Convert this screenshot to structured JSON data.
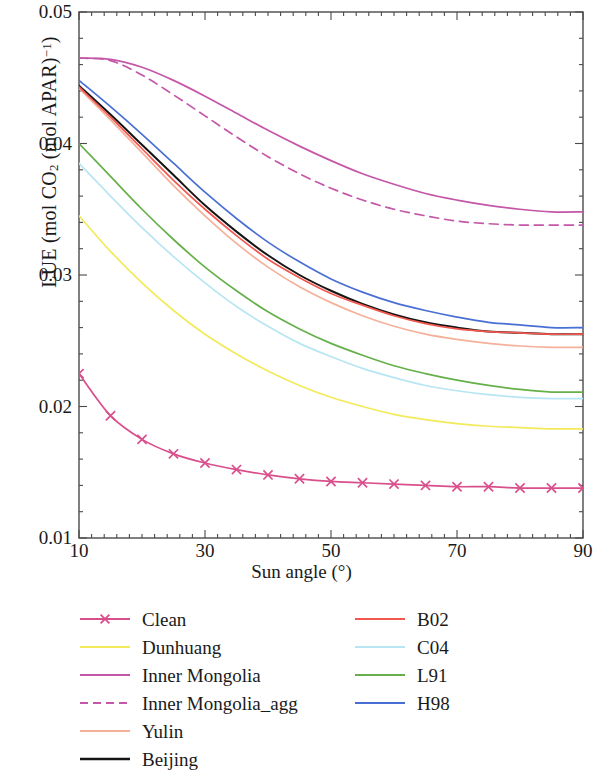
{
  "chart_data": {
    "type": "line",
    "title": "",
    "xlabel": "Sun angle (°)",
    "ylabel": "LUE (mol CO2 (mol APAR)-1)",
    "ylabel_parts": {
      "pre": "LUE (mol CO",
      "sub": "2",
      "mid": " (mol APAR)",
      "sup": "−1",
      "post": ")"
    },
    "xlim": [
      10,
      90
    ],
    "ylim": [
      0.01,
      0.05
    ],
    "xticks": [
      10,
      30,
      50,
      70,
      90
    ],
    "xtick_labels": [
      "10",
      "30",
      "50",
      "70",
      "90"
    ],
    "yticks": [
      0.01,
      0.02,
      0.03,
      0.04,
      0.05
    ],
    "ytick_labels": [
      "0.01",
      "0.02",
      "0.03",
      "0.04",
      "0.05"
    ],
    "x_minor_tick_step": 2,
    "y_minor_tick_step": 0.002,
    "grid": false,
    "legend_position": "below-plot",
    "legend_columns": 2,
    "x": [
      10,
      15,
      20,
      25,
      30,
      35,
      40,
      45,
      50,
      55,
      60,
      65,
      70,
      75,
      80,
      85,
      90
    ],
    "series": [
      {
        "name": "Clean",
        "color": "#d94f8c",
        "style": "solid",
        "marker": "x",
        "column": "left",
        "values": [
          0.0225,
          0.0193,
          0.0175,
          0.0164,
          0.0157,
          0.0152,
          0.0148,
          0.0145,
          0.0143,
          0.0142,
          0.0141,
          0.014,
          0.0139,
          0.0139,
          0.0138,
          0.0138,
          0.0138
        ]
      },
      {
        "name": "Dunhuang",
        "color": "#f2ea5a",
        "style": "solid",
        "marker": "none",
        "column": "left",
        "values": [
          0.0345,
          0.0318,
          0.0294,
          0.0273,
          0.0255,
          0.024,
          0.0227,
          0.0216,
          0.0207,
          0.02,
          0.0194,
          0.019,
          0.0187,
          0.0185,
          0.0184,
          0.0183,
          0.0183
        ]
      },
      {
        "name": "Inner Mongolia",
        "color": "#c457a8",
        "style": "solid",
        "marker": "none",
        "column": "left",
        "values": [
          0.0465,
          0.0464,
          0.0458,
          0.0448,
          0.0436,
          0.0423,
          0.041,
          0.0398,
          0.0387,
          0.0377,
          0.0369,
          0.0362,
          0.0357,
          0.0353,
          0.035,
          0.0348,
          0.0348
        ]
      },
      {
        "name": "Inner Mongolia_agg",
        "color": "#c457a8",
        "style": "dashed",
        "marker": "none",
        "column": "left",
        "values": [
          0.0465,
          0.0463,
          0.0452,
          0.0437,
          0.0421,
          0.0405,
          0.039,
          0.0377,
          0.0366,
          0.0357,
          0.035,
          0.0345,
          0.0341,
          0.0339,
          0.0338,
          0.0338,
          0.0338
        ]
      },
      {
        "name": "Yulin",
        "color": "#f5b09a",
        "style": "solid",
        "marker": "none",
        "column": "left",
        "values": [
          0.0442,
          0.0418,
          0.0393,
          0.0368,
          0.0345,
          0.0324,
          0.0306,
          0.0291,
          0.0279,
          0.0269,
          0.0261,
          0.0255,
          0.0251,
          0.0248,
          0.0246,
          0.0245,
          0.0245
        ]
      },
      {
        "name": "Beijing",
        "color": "#141414",
        "style": "solid",
        "marker": "none",
        "column": "left",
        "values": [
          0.0444,
          0.0422,
          0.0399,
          0.0376,
          0.0353,
          0.0333,
          0.0315,
          0.03,
          0.0288,
          0.0278,
          0.027,
          0.0264,
          0.026,
          0.0257,
          0.0256,
          0.0255,
          0.0255
        ]
      },
      {
        "name": "B02",
        "color": "#f2584f",
        "style": "solid",
        "marker": "none",
        "column": "right",
        "values": [
          0.0443,
          0.042,
          0.0396,
          0.0372,
          0.035,
          0.033,
          0.0312,
          0.0298,
          0.0286,
          0.0277,
          0.0269,
          0.0263,
          0.0259,
          0.0257,
          0.0256,
          0.0255,
          0.0255
        ]
      },
      {
        "name": "C04",
        "color": "#b7e6f2",
        "style": "solid",
        "marker": "none",
        "column": "right",
        "values": [
          0.0385,
          0.036,
          0.0336,
          0.0314,
          0.0294,
          0.0276,
          0.0261,
          0.0248,
          0.0238,
          0.0229,
          0.0222,
          0.0216,
          0.0212,
          0.0209,
          0.0207,
          0.0206,
          0.0206
        ]
      },
      {
        "name": "L91",
        "color": "#66b04a",
        "style": "solid",
        "marker": "none",
        "column": "right",
        "values": [
          0.04,
          0.0375,
          0.035,
          0.0327,
          0.0306,
          0.0288,
          0.0272,
          0.0259,
          0.0248,
          0.0239,
          0.0231,
          0.0225,
          0.022,
          0.0216,
          0.0213,
          0.0211,
          0.0211
        ]
      },
      {
        "name": "H98",
        "color": "#4a6fd4",
        "style": "solid",
        "marker": "none",
        "column": "right",
        "values": [
          0.0448,
          0.0428,
          0.0407,
          0.0385,
          0.0363,
          0.0343,
          0.0325,
          0.031,
          0.0297,
          0.0287,
          0.0279,
          0.0273,
          0.0268,
          0.0264,
          0.0262,
          0.026,
          0.026
        ]
      }
    ]
  }
}
